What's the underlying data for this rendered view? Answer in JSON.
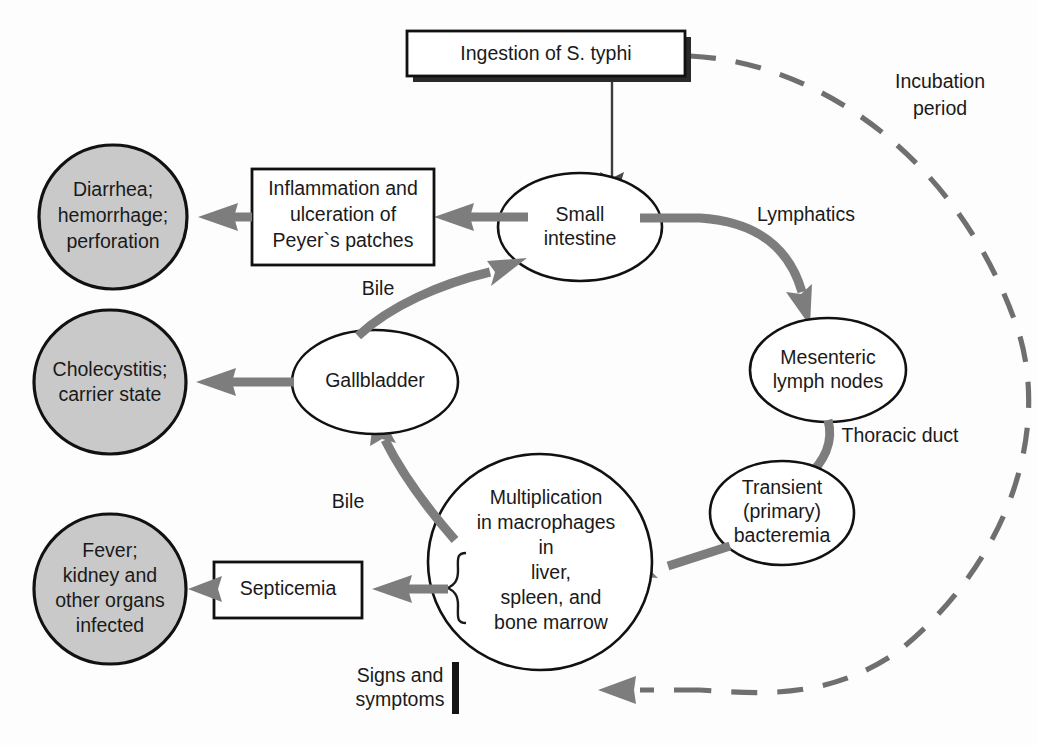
{
  "diagram": {
    "colors": {
      "outcome_fill": "#c9c9c9",
      "node_fill": "#ffffff",
      "stroke": "#111111",
      "arrow_gray": "#7d7d7d",
      "dashed_arc": "#6f6f6f",
      "text": "#1a1a1a"
    },
    "nodes": {
      "ingestion": {
        "shape": "box-with-shadow",
        "text_prefix": "Ingestion of ",
        "text_italic": "S. typhi"
      },
      "small_intestine": {
        "shape": "ellipse",
        "line1": "Small",
        "line2": "intestine"
      },
      "inflammation": {
        "shape": "box",
        "line1": "Inflammation and",
        "line2": "ulceration of",
        "line3": "Peyer`s patches"
      },
      "diarrhea": {
        "shape": "filled-circle",
        "line1": "Diarrhea;",
        "line2": "hemorrhage;",
        "line3": "perforation"
      },
      "mesenteric": {
        "shape": "ellipse",
        "line1": "Mesenteric",
        "line2": "lymph nodes"
      },
      "transient": {
        "shape": "ellipse",
        "line1": "Transient",
        "line2": "(primary)",
        "line3": "bacteremia"
      },
      "multiplication": {
        "shape": "circle",
        "line1": "Multiplication",
        "line2": "in macrophages",
        "line3": "in",
        "line4": "liver,",
        "line5": "spleen, and",
        "line6": "bone marrow"
      },
      "gallbladder": {
        "shape": "ellipse",
        "line1": "Gallbladder"
      },
      "cholecystitis": {
        "shape": "filled-circle",
        "line1": "Cholecystitis;",
        "line2": "carrier state"
      },
      "septicemia": {
        "shape": "box",
        "line1": "Septicemia"
      },
      "fever": {
        "shape": "filled-circle",
        "line1": "Fever;",
        "line2": "kidney and",
        "line3": "other organs",
        "line4": "infected"
      },
      "signs": {
        "shape": "label-with-bar",
        "line1": "Signs and",
        "line2": "symptoms"
      }
    },
    "edge_labels": {
      "incubation_line1": "Incubation",
      "incubation_line2": "period",
      "lymphatics": "Lymphatics",
      "thoracic_duct": "Thoracic duct",
      "bile_upper": "Bile",
      "bile_lower": "Bile"
    },
    "flow": [
      {
        "from": "ingestion",
        "to": "small_intestine",
        "label": ""
      },
      {
        "from": "small_intestine",
        "to": "inflammation",
        "label": ""
      },
      {
        "from": "inflammation",
        "to": "diarrhea",
        "label": ""
      },
      {
        "from": "small_intestine",
        "to": "mesenteric",
        "label": "Lymphatics"
      },
      {
        "from": "mesenteric",
        "to": "transient",
        "label": "Thoracic duct"
      },
      {
        "from": "transient",
        "to": "multiplication",
        "label": ""
      },
      {
        "from": "multiplication",
        "to": "gallbladder",
        "label": "Bile"
      },
      {
        "from": "gallbladder",
        "to": "small_intestine",
        "label": "Bile"
      },
      {
        "from": "gallbladder",
        "to": "cholecystitis",
        "label": ""
      },
      {
        "from": "multiplication",
        "to": "septicemia",
        "label": ""
      },
      {
        "from": "septicemia",
        "to": "fever",
        "label": ""
      },
      {
        "from": "ingestion",
        "to": "signs",
        "label": "Incubation period",
        "style": "dashed"
      }
    ]
  }
}
